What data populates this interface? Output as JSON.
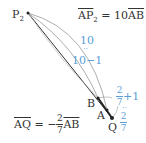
{
  "points": {
    "P2": {
      "label": "P",
      "sub": "2",
      "x": 28,
      "y": 13
    },
    "B": {
      "label": "B",
      "x": 98,
      "y": 98
    },
    "A": {
      "label": "A",
      "x": 107,
      "y": 110
    },
    "Q": {
      "label": "Q",
      "x": 112,
      "y": 118
    }
  },
  "equations": {
    "ap2": {
      "lhs": "AP",
      "lhs_sub": "2",
      "eq": " = 10",
      "rhs": "AB"
    },
    "aq": {
      "lhs": "AQ",
      "eq": " = −",
      "num": "2",
      "den": "7",
      "rhs": "AB"
    }
  },
  "annotations": {
    "ten": "10",
    "colon1": "··",
    "ten_minus_one": "10−1",
    "frac_plus_num": "2",
    "frac_plus_den": "7",
    "plus_one": "+1",
    "colon2": "··",
    "frac2_num": "2",
    "frac2_den": "7"
  },
  "colors": {
    "line": "#333333",
    "arc": "#888888",
    "accent": "#5aa0d8"
  }
}
